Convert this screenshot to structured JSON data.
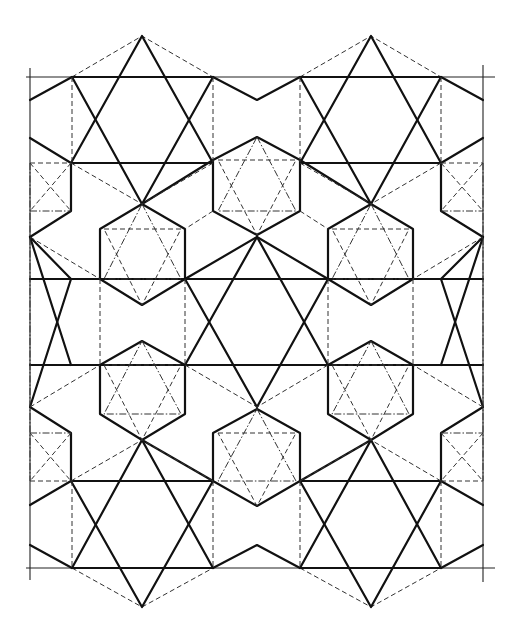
{
  "diagram": {
    "title": "",
    "colors": {
      "line": "#111111",
      "construction": "#333333",
      "background": "#ffffff"
    },
    "frame": {
      "left_x": 30,
      "right_x": 483,
      "top_y": 77,
      "bottom_y": 568
    },
    "large_stars": [
      {
        "cx": 142,
        "cy": 120,
        "label": ""
      },
      {
        "cx": 371,
        "cy": 120,
        "label": ""
      },
      {
        "cx": 257,
        "cy": 322,
        "label": ""
      },
      {
        "cx": 142,
        "cy": 524,
        "label": ""
      },
      {
        "cx": 371,
        "cy": 524,
        "label": ""
      }
    ],
    "small_hexagons": [
      {
        "cx": 257,
        "cy": 198
      },
      {
        "cx": 142,
        "cy": 266
      },
      {
        "cx": 371,
        "cy": 266
      },
      {
        "cx": 142,
        "cy": 376
      },
      {
        "cx": 371,
        "cy": 376
      },
      {
        "cx": 257,
        "cy": 446
      }
    ]
  }
}
